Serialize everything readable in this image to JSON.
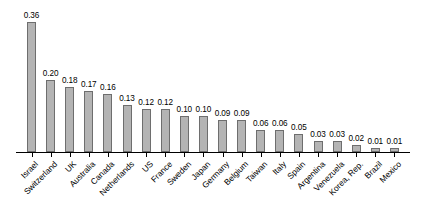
{
  "chart_data": {
    "type": "bar",
    "title": "",
    "subtitle": "",
    "xlabel": "",
    "ylabel": "",
    "ylim": [
      0,
      0.36
    ],
    "grid": false,
    "legend": null,
    "value_label_format": "0.00",
    "categories": [
      "Israel",
      "Switzerland",
      "UK",
      "Australia",
      "Canada",
      "Netherlands",
      "US",
      "France",
      "Sweden",
      "Japan",
      "Germany",
      "Belgium",
      "Taiwan",
      "Italy",
      "Spain",
      "Argentina",
      "Venezuela",
      "Korea, Rep.",
      "Brazil",
      "Mexico"
    ],
    "values": [
      0.36,
      0.2,
      0.18,
      0.17,
      0.16,
      0.13,
      0.12,
      0.12,
      0.1,
      0.1,
      0.09,
      0.09,
      0.06,
      0.06,
      0.05,
      0.03,
      0.03,
      0.02,
      0.01,
      0.01
    ],
    "value_labels": [
      "0.36",
      "0.20",
      "0.18",
      "0.17",
      "0.16",
      "0.13",
      "0.12",
      "0.12",
      "0.10",
      "0.10",
      "0.09",
      "0.09",
      "0.06",
      "0.06",
      "0.05",
      "0.03",
      "0.03",
      "0.02",
      "0.01",
      "0.01"
    ],
    "bar_color": "#b4b4b4",
    "bar_border_color": "#6e6e6e",
    "axis_color": "#000000",
    "text_color": "#000000",
    "background_color": "#ffffff"
  }
}
